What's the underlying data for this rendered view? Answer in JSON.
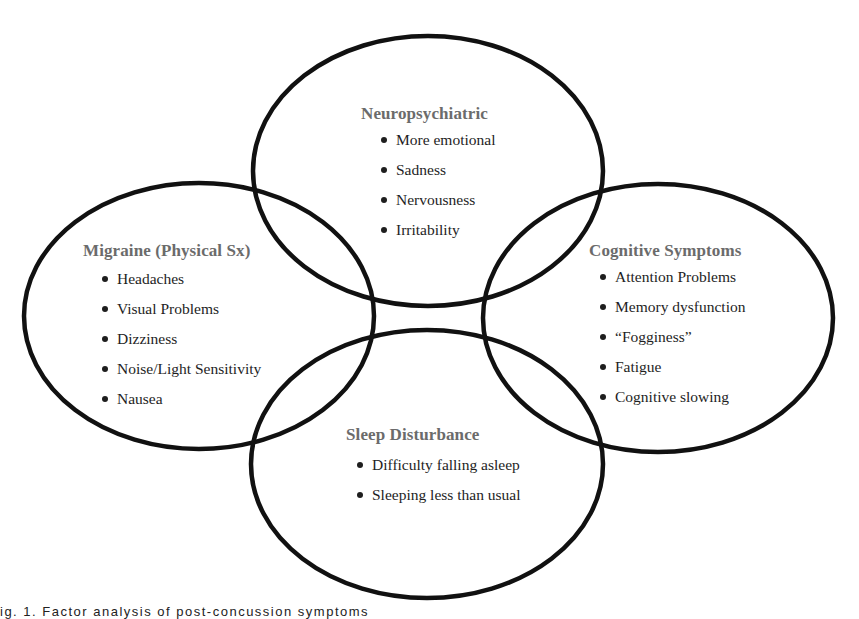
{
  "diagram": {
    "type": "venn",
    "stroke_color": "#111111",
    "heading_color": "#6b6b6b",
    "text_color": "#1e1e1e",
    "ellipses": [
      {
        "name": "neuropsychiatric",
        "cx": 428,
        "cy": 171,
        "rx": 175,
        "ry": 135
      },
      {
        "name": "migraine",
        "cx": 199,
        "cy": 316,
        "rx": 175,
        "ry": 133
      },
      {
        "name": "cognitive",
        "cx": 658,
        "cy": 318,
        "rx": 175,
        "ry": 134
      },
      {
        "name": "sleep",
        "cx": 427,
        "cy": 464,
        "rx": 176,
        "ry": 134
      }
    ],
    "groups": {
      "neuropsychiatric": {
        "title": "Neuropsychiatric",
        "items": [
          "More emotional",
          "Sadness",
          "Nervousness",
          "Irritability"
        ]
      },
      "migraine": {
        "title": "Migraine (Physical Sx)",
        "items": [
          "Headaches",
          "Visual Problems",
          "Dizziness",
          "Noise/Light Sensitivity",
          "Nausea"
        ]
      },
      "cognitive": {
        "title": "Cognitive Symptoms",
        "items": [
          "Attention Problems",
          "Memory dysfunction",
          "“Fogginess”",
          "Fatigue",
          "Cognitive slowing"
        ]
      },
      "sleep": {
        "title": "Sleep Disturbance",
        "items": [
          "Difficulty falling asleep",
          "Sleeping less than usual"
        ]
      }
    },
    "caption": "ig. 1. Factor analysis of post-concussion symptoms"
  }
}
